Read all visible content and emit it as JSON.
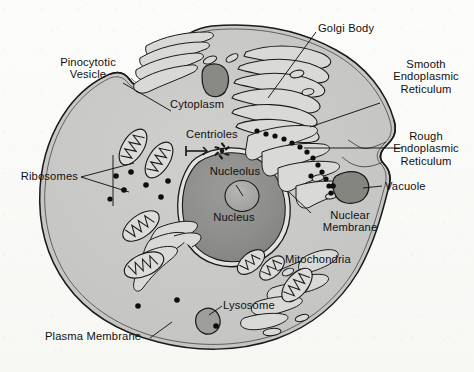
{
  "diagram": {
    "background_color": "#fbfbf9",
    "cytoplasm_color": "#c9c9c7",
    "nucleus_color": "#8e8e8c",
    "nucleolus_color": "#a8a8a6",
    "outline_color": "#1a1a1a",
    "organelle_fill": "#d8d8d6",
    "vacuole_fill": "#8a8a88"
  },
  "labels": {
    "pinocytotic_vesicle": "Pinocytotic\nVesicle",
    "ribosomes": "Ribosomes",
    "plasma_membrane": "Plasma Membrane",
    "cytoplasm": "Cytoplasm",
    "centrioles": "Centrioles",
    "nucleolus": "Nucleolus",
    "nucleus": "Nucleus",
    "lysosome": "Lysosome",
    "golgi_body": "Golgi Body",
    "smooth_er": "Smooth\nEndoplasmic\nReticulum",
    "rough_er": "Rough\nEndoplasmic\nReticulum",
    "vacuole": "Vacuole",
    "nuclear_membrane": "Nuclear\nMembrane",
    "mitochondria": "Mitochondria"
  },
  "structures": {
    "mitochondria_count": 7,
    "free_ribosome_count": 11,
    "rough_er_ribosome_count": 13,
    "golgi_stack_count": 6,
    "vacuole_count": 2,
    "lysosome_count": 1,
    "centriole_count": 2
  }
}
